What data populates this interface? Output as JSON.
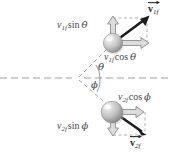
{
  "figure": {
    "kind": "physics-vector-diagram",
    "background_color": "#ffffff",
    "ink_color": "#4a4a4a",
    "vector_color": "#1a1a1a",
    "component_arrow_fill": "#d9d9d9",
    "component_arrow_stroke": "#8c8c8c",
    "dashed_color": "#a6a6a6",
    "sphere_light": "#f2f2f2",
    "sphere_mid": "#c9c9c9",
    "sphere_dark": "#8f8f8f"
  },
  "labels": {
    "v1f_sin_theta": {
      "var": "v",
      "sub": "1f",
      "fn": "sin",
      "angle": "θ"
    },
    "v1f_cos_theta": {
      "var": "v",
      "sub": "1f",
      "fn": "cos",
      "angle": "θ"
    },
    "v2f_cos_phi": {
      "var": "v",
      "sub": "2f",
      "fn": "cos",
      "angle": "ϕ"
    },
    "v2f_sin_phi": {
      "var": "v",
      "sub": "2f",
      "fn": "sin",
      "angle": "ϕ"
    },
    "v1f_vector": {
      "var": "v",
      "sub": "1f"
    },
    "v2f_vector": {
      "var": "v",
      "sub": "2f"
    },
    "theta": "θ",
    "phi": "ϕ"
  },
  "geometry": {
    "vertex": {
      "x": 78,
      "y": 78
    },
    "axis_line": {
      "x1": 0,
      "y1": 78,
      "x2": 170,
      "y2": 78
    },
    "particle_1": {
      "cx": 113,
      "cy": 43,
      "r": 10
    },
    "particle_2": {
      "cx": 113,
      "cy": 112,
      "r": 11
    },
    "theta_deg": 35,
    "phi_deg": 38
  }
}
